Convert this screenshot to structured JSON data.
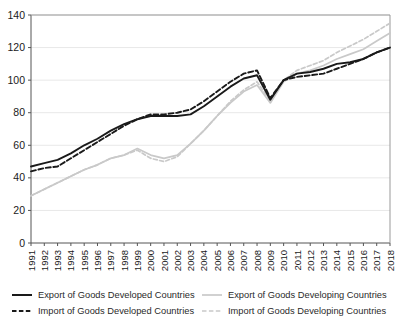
{
  "chart_data": {
    "type": "line",
    "title": "",
    "subtitle": "",
    "xlabel": "",
    "ylabel": "",
    "xlim": [
      1991,
      2018
    ],
    "ylim": [
      0,
      140
    ],
    "grid": true,
    "grid_axis": "y",
    "legend_position": "bottom",
    "legend_columns": 2,
    "yticks": [
      0,
      20,
      40,
      60,
      80,
      100,
      120,
      140
    ],
    "ytick_labels": [
      "0",
      "20",
      "40",
      "60",
      "80",
      "100",
      "120",
      "140"
    ],
    "x": [
      1991,
      1992,
      1993,
      1994,
      1995,
      1996,
      1997,
      1998,
      1999,
      2000,
      2001,
      2002,
      2003,
      2004,
      2005,
      2006,
      2007,
      2008,
      2009,
      2010,
      2011,
      2012,
      2013,
      2014,
      2015,
      2016,
      2017,
      2018
    ],
    "xtick_labels": [
      "1991",
      "1992",
      "1993",
      "1994",
      "1995",
      "1996",
      "1997",
      "1998",
      "1999",
      "2000",
      "2001",
      "2002",
      "2003",
      "2004",
      "2005",
      "2006",
      "2007",
      "2008",
      "2009",
      "2010",
      "2011",
      "2012",
      "2013",
      "2014",
      "2015",
      "2016",
      "2017",
      "2018"
    ],
    "series": [
      {
        "name": "Export of Goods Developed Countries",
        "style": "solid",
        "color": "#1a1a1a",
        "width": 1.9,
        "values": [
          47,
          49,
          51,
          55,
          60,
          64,
          69,
          73,
          76,
          78,
          78,
          78,
          79,
          84,
          90,
          96,
          101,
          103,
          88,
          100,
          104,
          105,
          107,
          110,
          111,
          113,
          117,
          120
        ]
      },
      {
        "name": "Import of Goods Developed Countries",
        "style": "dashed",
        "color": "#1a1a1a",
        "width": 1.9,
        "values": [
          44,
          46,
          47,
          52,
          57,
          62,
          67,
          72,
          76,
          79,
          79,
          80,
          82,
          87,
          93,
          99,
          104,
          106,
          89,
          100,
          102,
          103,
          104,
          107,
          110,
          113,
          117,
          120
        ]
      },
      {
        "name": "Export of Goods Developing Countries",
        "style": "solid",
        "color": "#c9c9c9",
        "width": 1.7,
        "values": [
          29,
          33,
          37,
          41,
          45,
          48,
          52,
          54,
          58,
          54,
          52,
          54,
          61,
          69,
          78,
          86,
          93,
          97,
          86,
          99,
          104,
          106,
          109,
          113,
          116,
          119,
          124,
          129
        ]
      },
      {
        "name": "Import of Goods Developing Countries",
        "style": "dashed",
        "color": "#c9c9c9",
        "width": 1.7,
        "values": [
          29,
          33,
          37,
          41,
          45,
          48,
          52,
          54,
          57,
          52,
          50,
          53,
          61,
          69,
          78,
          87,
          94,
          99,
          87,
          100,
          106,
          109,
          112,
          117,
          121,
          125,
          130,
          135
        ]
      }
    ]
  },
  "legend": {
    "entries": [
      {
        "label": "Export of Goods Developed Countries",
        "style": "solid",
        "color": "#1a1a1a"
      },
      {
        "label": "Import of Goods Developed Countries",
        "style": "dashed",
        "color": "#1a1a1a"
      },
      {
        "label": "Export of Goods Developing Countries",
        "style": "solid",
        "color": "#c9c9c9"
      },
      {
        "label": "Import of Goods Developing Countries",
        "style": "dashed",
        "color": "#c9c9c9"
      }
    ]
  },
  "colors": {
    "developed": "#1a1a1a",
    "developing": "#c9c9c9",
    "grid": "#e8e8e8",
    "axis": "#555555",
    "background": "#ffffff"
  }
}
